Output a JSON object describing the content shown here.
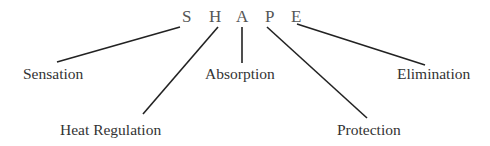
{
  "diagram": {
    "acronym": [
      "S",
      "H",
      "A",
      "P",
      "E"
    ],
    "labels": {
      "s": "Sensation",
      "h": "Heat Regulation",
      "a": "Absorption",
      "p": "Protection",
      "e": "Elimination"
    },
    "line_color": "#222222",
    "text_color": "#333333",
    "letter_color": "#555555"
  }
}
